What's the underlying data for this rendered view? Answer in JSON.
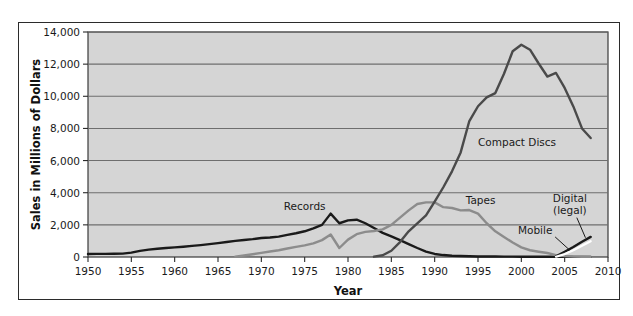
{
  "chart_data": {
    "type": "line",
    "title": "",
    "xlabel": "Year",
    "ylabel": "Sales in Millions of Dollars",
    "xlim": [
      1950,
      2010
    ],
    "ylim": [
      0,
      14000
    ],
    "xticks": [
      "1950",
      "1955",
      "1960",
      "1965",
      "1970",
      "1975",
      "1980",
      "1985",
      "1990",
      "1995",
      "2000",
      "2005",
      "2010"
    ],
    "yticks": [
      "0",
      "2,000",
      "4,000",
      "6,000",
      "8,000",
      "10,000",
      "12,000",
      "14,000"
    ],
    "grid": "horizontal",
    "legend_position": "inline-annotations",
    "plot_background": "#d5d5d5",
    "gridline_color": "#6e6e6e",
    "series": [
      {
        "name": "Records",
        "label": "Records",
        "color": "#1a1a1a",
        "label_x": 1975.0,
        "label_y": 2950,
        "x": [
          1950,
          1951,
          1952,
          1953,
          1954,
          1955,
          1956,
          1957,
          1958,
          1959,
          1960,
          1961,
          1962,
          1963,
          1964,
          1965,
          1966,
          1967,
          1968,
          1969,
          1970,
          1971,
          1972,
          1973,
          1974,
          1975,
          1976,
          1977,
          1978,
          1979,
          1980,
          1981,
          1982,
          1983,
          1984,
          1985,
          1986,
          1987,
          1988,
          1989,
          1990,
          1991,
          1992,
          1993,
          1994,
          1995,
          1996,
          1997,
          1998,
          1999,
          2000,
          2001,
          2002,
          2003,
          2004,
          2005,
          2006,
          2007,
          2008
        ],
        "values": [
          190,
          195,
          195,
          200,
          210,
          270,
          380,
          460,
          510,
          560,
          600,
          640,
          690,
          740,
          800,
          860,
          930,
          1000,
          1060,
          1110,
          1180,
          1210,
          1270,
          1380,
          1480,
          1600,
          1780,
          2000,
          2700,
          2100,
          2280,
          2320,
          2100,
          1800,
          1500,
          1280,
          1050,
          800,
          560,
          340,
          190,
          120,
          80,
          60,
          45,
          35,
          30,
          28,
          25,
          22,
          20,
          18,
          16,
          14,
          12,
          10,
          9,
          8,
          8
        ]
      },
      {
        "name": "Tapes",
        "label": "Tapes",
        "color": "#8c8c8c",
        "label_x": 1995.3,
        "label_y": 3300,
        "x": [
          1967,
          1968,
          1969,
          1970,
          1971,
          1972,
          1973,
          1974,
          1975,
          1976,
          1977,
          1978,
          1979,
          1980,
          1981,
          1982,
          1983,
          1984,
          1985,
          1986,
          1987,
          1988,
          1989,
          1990,
          1991,
          1992,
          1993,
          1994,
          1995,
          1996,
          1997,
          1998,
          1999,
          2000,
          2001,
          2002,
          2003,
          2004,
          2005,
          2006,
          2007,
          2008
        ],
        "values": [
          20,
          90,
          170,
          260,
          340,
          420,
          530,
          630,
          720,
          850,
          1050,
          1400,
          560,
          1080,
          1420,
          1560,
          1620,
          1720,
          2000,
          2450,
          2900,
          3300,
          3400,
          3400,
          3100,
          3050,
          2900,
          2920,
          2700,
          2100,
          1600,
          1250,
          900,
          600,
          420,
          330,
          250,
          120,
          60,
          30,
          15,
          10
        ]
      },
      {
        "name": "Compact Discs",
        "label": "Compact Discs",
        "color": "#4a4a4a",
        "label_x": 1999.5,
        "label_y": 6900,
        "x": [
          1983,
          1984,
          1985,
          1986,
          1987,
          1988,
          1989,
          1990,
          1991,
          1992,
          1993,
          1994,
          1995,
          1996,
          1997,
          1998,
          1999,
          2000,
          2001,
          2002,
          2003,
          2004,
          2005,
          2006,
          2007,
          2008
        ],
        "values": [
          20,
          110,
          390,
          930,
          1600,
          2090,
          2590,
          3450,
          4340,
          5330,
          6510,
          8460,
          9380,
          9930,
          10200,
          11400,
          12800,
          13210,
          12900,
          12040,
          11230,
          11450,
          10520,
          9370,
          8000,
          7400
        ]
      },
      {
        "name": "Digital (legal)",
        "label": "Digital\n(legal)",
        "color": "#1a1a1a",
        "label_x": 2005.6,
        "label_y": 3450,
        "x": [
          2004,
          2005,
          2006,
          2007,
          2008
        ],
        "values": [
          40,
          320,
          620,
          950,
          1250
        ]
      },
      {
        "name": "Mobile",
        "label": "Mobile",
        "color": "#ffffff",
        "label_x": 2001.6,
        "label_y": 1450,
        "x": [
          2004,
          2005,
          2006,
          2007,
          2008
        ],
        "values": [
          20,
          180,
          420,
          700,
          980
        ]
      }
    ],
    "annotations": [
      {
        "name": "digital-leader-line",
        "from_x": 2006.4,
        "from_y": 2450,
        "to_x": 2007.4,
        "to_y": 1200
      },
      {
        "name": "mobile-leader-line",
        "from_x": 2003.9,
        "from_y": 1250,
        "to_x": 2005.6,
        "to_y": 420
      }
    ]
  },
  "figure": {
    "x_axis_title": "Year",
    "y_axis_title": "Sales in Millions of Dollars"
  }
}
